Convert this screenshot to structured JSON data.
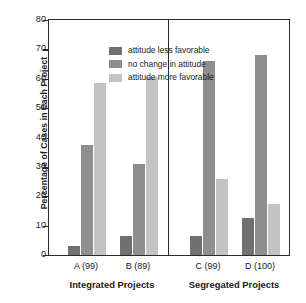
{
  "chart_data": {
    "type": "bar",
    "title": "",
    "xlabel": "",
    "ylabel": "Percentage of Cases in Each Project",
    "ylim": [
      0,
      80
    ],
    "yticks": [
      0,
      10,
      20,
      30,
      40,
      50,
      60,
      70,
      80
    ],
    "grid": false,
    "legend_position": "upper-left-inside",
    "categories": [
      "A (99)",
      "B (89)",
      "C (99)",
      "D (100)"
    ],
    "panels": [
      {
        "label": "Integrated Projects",
        "categories": [
          "A (99)",
          "B (89)"
        ]
      },
      {
        "label": "Segregated Projects",
        "categories": [
          "C (99)",
          "D (100)"
        ]
      }
    ],
    "series": [
      {
        "name": "attitude less favorable",
        "color": "#70706e",
        "values": [
          3,
          6.5,
          6.5,
          12.5
        ]
      },
      {
        "name": "no change in attitude",
        "color": "#8e8e8c",
        "values": [
          37.5,
          31,
          66,
          68
        ]
      },
      {
        "name": "attitude more favorable",
        "color": "#c3c3c1",
        "values": [
          58.5,
          60.5,
          26,
          17.5
        ]
      }
    ]
  },
  "axis": {
    "frame_color": "#2b2b2b"
  }
}
